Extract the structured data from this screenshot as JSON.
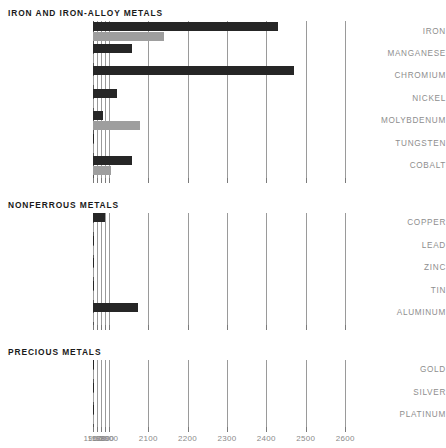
{
  "chart_data": {
    "type": "bar",
    "title": "",
    "orientation": "horizontal",
    "xlabel": "",
    "ylabel": "",
    "xlim": [
      1960,
      2600
    ],
    "grid": true,
    "legend_position": "none",
    "series": [
      {
        "name": "dark",
        "color": "#262626"
      },
      {
        "name": "light",
        "color": "#9e9e9e"
      }
    ],
    "xticks": [
      1960,
      1970,
      1980,
      1990,
      2000,
      2100,
      2200,
      2300,
      2400,
      2500,
      2600
    ],
    "xtick_labels": [
      "1960",
      "1970",
      "1980",
      "1990",
      "2000",
      "2100",
      "2200",
      "2300",
      "2400",
      "2500",
      "2600"
    ],
    "sections": [
      {
        "title": "IRON AND IRON-ALLOY METALS",
        "categories": [
          "IRON",
          "MANGANESE",
          "CHROMIUM",
          "NICKEL",
          "MOLYBDENUM",
          "TUNGSTEN",
          "COBALT"
        ],
        "dark": [
          2430,
          2060,
          2470,
          2020,
          1985,
          1930,
          2060
        ],
        "light": [
          2140,
          1815,
          1840,
          1825,
          2080,
          1880,
          2005
        ]
      },
      {
        "title": "NONFERROUS METALS",
        "categories": [
          "COPPER",
          "LEAD",
          "ZINC",
          "TIN",
          "ALUMINUM"
        ],
        "dark": [
          1990,
          1850,
          1860,
          1865,
          2075
        ],
        "light": [
          1895,
          1790,
          1820,
          1735,
          1760
        ]
      },
      {
        "title": "PRECIOUS METALS",
        "categories": [
          "GOLD",
          "SILVER",
          "PLATINUM"
        ],
        "dark": [
          1860,
          1860,
          1855
        ],
        "light": [
          1790,
          1780,
          1735
        ]
      }
    ]
  }
}
